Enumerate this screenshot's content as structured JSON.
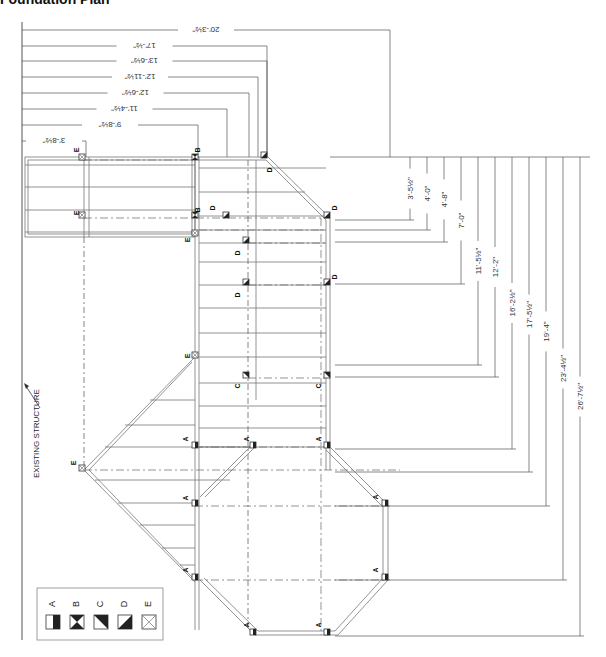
{
  "title": "Foundation Plan",
  "top_dimensions": [
    {
      "label": "20'-3½\"",
      "y": 30,
      "x_end": 390
    },
    {
      "label": "17'-½\"",
      "y": 46,
      "x_end": 267
    },
    {
      "label": "13'-6½\"",
      "y": 61,
      "x_end": 267
    },
    {
      "label": "12'-11½\"",
      "y": 77,
      "x_end": 258
    },
    {
      "label": "12'-6½\"",
      "y": 93,
      "x_end": 249
    },
    {
      "label": "11'-4½\"",
      "y": 109,
      "x_end": 227
    },
    {
      "label": "9'-8½\"",
      "y": 125,
      "x_end": 198
    },
    {
      "label": "3'-8½\"",
      "y": 141,
      "x_end": 86
    }
  ],
  "right_dimensions": [
    {
      "label": "3'-5½\"",
      "x": 410,
      "y_end": 220
    },
    {
      "label": "4'-0\"",
      "x": 427,
      "y_end": 230
    },
    {
      "label": "4'-8\"",
      "x": 444,
      "y_end": 242
    },
    {
      "label": "7'-0\"",
      "x": 461,
      "y_end": 284
    },
    {
      "label": "11'-5½\"",
      "x": 478,
      "y_end": 365
    },
    {
      "label": "12'-2\"",
      "x": 495,
      "y_end": 377
    },
    {
      "label": "16'-2½\"",
      "x": 512,
      "y_end": 449
    },
    {
      "label": "17'-5½\"",
      "x": 529,
      "y_end": 472
    },
    {
      "label": "19'-4\"",
      "x": 546,
      "y_end": 506
    },
    {
      "label": "23'-4½\"",
      "x": 563,
      "y_end": 580
    },
    {
      "label": "26'-7½\"",
      "x": 580,
      "y_end": 636
    }
  ],
  "existing_structure_label": "EXISTING STRUCTURE",
  "legend": {
    "items": [
      {
        "key": "A",
        "symbol": "half-filled-vertical"
      },
      {
        "key": "B",
        "symbol": "hourglass-filled"
      },
      {
        "key": "C",
        "symbol": "diagonal-filled-upper-right"
      },
      {
        "key": "D",
        "symbol": "diagonal-filled-lower-right"
      },
      {
        "key": "E",
        "symbol": "x-box-open"
      }
    ]
  },
  "post_labels": [
    {
      "text": "E",
      "x": 79,
      "y": 150
    },
    {
      "text": "B",
      "x": 200,
      "y": 150
    },
    {
      "text": "D",
      "x": 272,
      "y": 170
    },
    {
      "text": "B",
      "x": 200,
      "y": 210
    },
    {
      "text": "D",
      "x": 215,
      "y": 208
    },
    {
      "text": "E",
      "x": 79,
      "y": 213
    },
    {
      "text": "D",
      "x": 337,
      "y": 208
    },
    {
      "text": "E",
      "x": 190,
      "y": 240
    },
    {
      "text": "D",
      "x": 240,
      "y": 253
    },
    {
      "text": "D",
      "x": 337,
      "y": 277
    },
    {
      "text": "D",
      "x": 240,
      "y": 295
    },
    {
      "text": "E",
      "x": 190,
      "y": 356
    },
    {
      "text": "C",
      "x": 240,
      "y": 386
    },
    {
      "text": "C",
      "x": 321,
      "y": 386
    },
    {
      "text": "A",
      "x": 188,
      "y": 439
    },
    {
      "text": "A",
      "x": 249,
      "y": 439
    },
    {
      "text": "A",
      "x": 321,
      "y": 439
    },
    {
      "text": "E",
      "x": 76,
      "y": 463
    },
    {
      "text": "A",
      "x": 188,
      "y": 498
    },
    {
      "text": "A",
      "x": 378,
      "y": 497
    },
    {
      "text": "A",
      "x": 188,
      "y": 570
    },
    {
      "text": "A",
      "x": 378,
      "y": 570
    },
    {
      "text": "A",
      "x": 249,
      "y": 625
    },
    {
      "text": "A",
      "x": 321,
      "y": 625
    }
  ]
}
